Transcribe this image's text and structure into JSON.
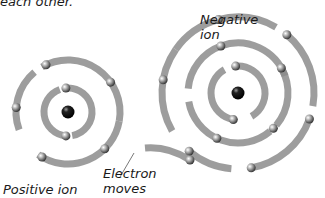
{
  "caption_fragment": "each other.",
  "labels": {
    "negative_ion": [
      "Negative",
      "ion"
    ],
    "positive_ion": "Positive ion",
    "electron_moves": [
      "Electron",
      "moves"
    ]
  },
  "colors": {
    "orbit": "#8c8c8c",
    "electron": "#9a9a9a",
    "nucleus": "#111111",
    "text": "#1a1a1a",
    "background": "#ffffff"
  },
  "positive_ion": {
    "nucleus": [
      68,
      112
    ],
    "shells": [
      {
        "radius": 24,
        "arcs": [
          [
            -95,
            80
          ],
          [
            95,
            250
          ]
        ],
        "electrons": [
          -95,
          95
        ]
      },
      {
        "radius": 52,
        "arcs": [
          [
            -120,
            10
          ],
          [
            10,
            125
          ],
          [
            160,
            230
          ]
        ],
        "electrons": [
          -115,
          -35,
          45,
          120,
          185
        ]
      }
    ]
  },
  "negative_ion": {
    "nucleus": [
      238,
      93
    ],
    "shells": [
      {
        "radius": 27,
        "arcs": [
          [
            -95,
            60
          ],
          [
            100,
            240
          ]
        ],
        "electrons": [
          -95,
          100
        ]
      },
      {
        "radius": 50,
        "arcs": [
          [
            -110,
            -20
          ],
          [
            -30,
            40
          ],
          [
            50,
            170
          ],
          [
            185,
            250
          ]
        ],
        "electrons": [
          -110,
          -30,
          45,
          115
        ]
      },
      {
        "radius": 76,
        "arcs": [
          [
            -105,
            -60
          ],
          [
            -50,
            10
          ],
          [
            20,
            80
          ],
          [
            95,
            130
          ],
          [
            150,
            215
          ],
          [
            215,
            255
          ]
        ],
        "electrons": [
          -105,
          -50,
          20,
          80,
          130,
          190
        ]
      }
    ]
  },
  "moving_electron": {
    "arc_from": [
      145,
      148
    ],
    "arc_to": [
      190,
      160
    ],
    "electron": [
      190,
      160
    ]
  },
  "pointer_line": {
    "from": [
      120,
      177
    ],
    "to": [
      134,
      153
    ]
  }
}
